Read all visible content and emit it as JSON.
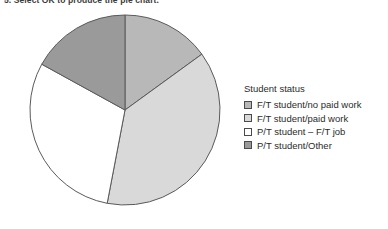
{
  "instruction": {
    "text": "5.  Select OK to produce the pie chart."
  },
  "legend": {
    "title": "Student status",
    "items": [
      {
        "label": "F/T student/no paid work",
        "color": "#b8b8b8"
      },
      {
        "label": "F/T student/paid work",
        "color": "#d9d9d9"
      },
      {
        "label": "P/T student – F/T job",
        "color": "#ffffff"
      },
      {
        "label": "P/T student/Other",
        "color": "#9a9a9a"
      }
    ]
  },
  "chart_data": {
    "type": "pie",
    "title": "",
    "legend_title": "Student status",
    "legend_position": "right",
    "categories": [
      "F/T student/no paid work",
      "F/T student/paid work",
      "P/T student – F/T job",
      "P/T student/Other"
    ],
    "values": [
      15,
      38,
      30,
      17
    ],
    "units": "percent",
    "colors": [
      "#b8b8b8",
      "#d9d9d9",
      "#ffffff",
      "#9a9a9a"
    ],
    "start_angle_deg": 0,
    "direction": "clockwise",
    "boundary_angles_deg": [
      0,
      53,
      190,
      297
    ],
    "outline_color": "#5a5a5a",
    "center_x": 125,
    "center_y": 110,
    "radius": 95
  }
}
